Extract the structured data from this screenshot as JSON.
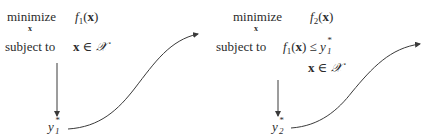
{
  "left_problem": {
    "objective_keyword": "minimize",
    "variable_under": "x",
    "objective": "f1(x)",
    "objective_func": "f",
    "objective_index": "1",
    "objective_arg": "x",
    "constraint_keyword": "subject to",
    "constraints": [
      "x ∈ 𝒳"
    ],
    "constraint_var": "x",
    "constraint_op": "∈",
    "constraint_set": "𝒳",
    "result_label": "y1*",
    "result_var": "y",
    "result_sub": "1",
    "result_sup": "*"
  },
  "right_problem": {
    "objective_keyword": "minimize",
    "variable_under": "x",
    "objective": "f2(x)",
    "objective_func": "f",
    "objective_index": "2",
    "objective_arg": "x",
    "constraint_keyword": "subject to",
    "constraints": [
      "f1(x) ≤ y1*",
      "x ∈ 𝒳"
    ],
    "c1_func": "f",
    "c1_index": "1",
    "c1_arg": "x",
    "c1_op": "≤",
    "c1_rhs_var": "y",
    "c1_rhs_sub": "1",
    "c1_rhs_sup": "*",
    "c2_var": "x",
    "c2_op": "∈",
    "c2_set": "𝒳",
    "result_label": "y2*",
    "result_var": "y",
    "result_sub": "2",
    "result_sup": "*"
  },
  "arrows": [
    {
      "from": "left_problem",
      "to": "y1*",
      "type": "straight-down"
    },
    {
      "from": "y1*",
      "to": "right_problem",
      "type": "s-curve"
    },
    {
      "from": "right_problem",
      "to": "y2*",
      "type": "straight-down"
    },
    {
      "from": "y2*",
      "to": "next",
      "type": "s-curve"
    }
  ],
  "colors": {
    "text": "#2b2b2b",
    "line": "#3a3a3a"
  }
}
